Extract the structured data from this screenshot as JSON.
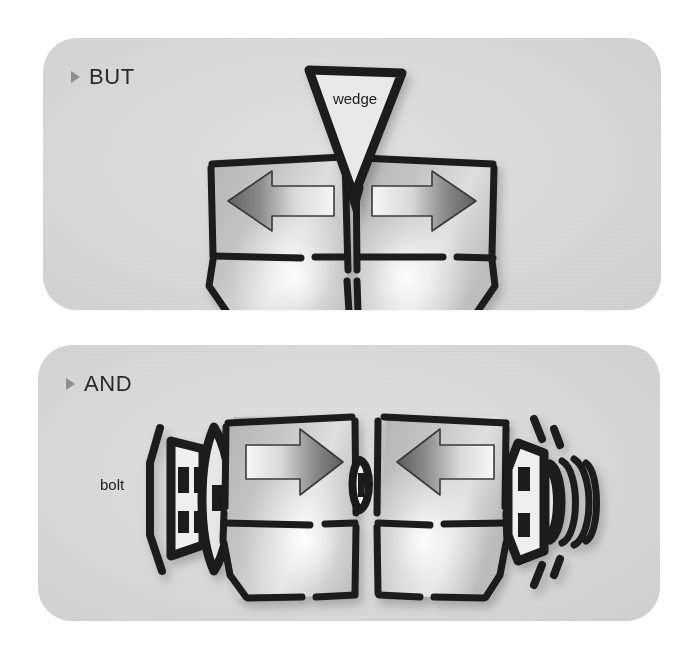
{
  "document": {
    "title": "Wedge versus bolt clamping illustration",
    "background_color": "#ffffff",
    "panel_color": "#dcdcdc",
    "ink_color": "#1a1a1a",
    "arrow_dark": "#6a6a6a",
    "arrow_light": "#f2f2f2"
  },
  "panels": [
    {
      "id": "but",
      "bullet": "triangle-right-bullet",
      "label": "BUT",
      "caption_label": "wedge",
      "concept": "A wedge driven down between two blocks forces them apart.",
      "blocks": [
        {
          "side": "left",
          "arrow_direction": "left",
          "arrow_label": ""
        },
        {
          "side": "right",
          "arrow_direction": "right",
          "arrow_label": ""
        }
      ],
      "annotations": [
        {
          "name": "wedge",
          "text": "wedge",
          "shape": "downward-triangle"
        }
      ]
    },
    {
      "id": "and",
      "bullet": "triangle-right-bullet",
      "label": "AND",
      "caption_label": "bolt",
      "concept": "A bolt and nut draw two blocks together.",
      "blocks": [
        {
          "side": "left",
          "arrow_direction": "right",
          "arrow_label": ""
        },
        {
          "side": "right",
          "arrow_direction": "left",
          "arrow_label": ""
        }
      ],
      "annotations": [
        {
          "name": "bolt",
          "text": "bolt",
          "shape": "bolt-head-with-washer"
        },
        {
          "name": "nut",
          "text": "",
          "shape": "nut-with-thread"
        }
      ]
    }
  ]
}
